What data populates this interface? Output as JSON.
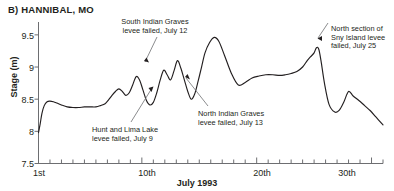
{
  "panel": {
    "title": "B) HANNIBAL, MO"
  },
  "axes": {
    "y_label": "Stage (m)",
    "x_label": "July 1993",
    "y_ticks": [
      "7.5",
      "8",
      "8.5",
      "9",
      "9.5"
    ],
    "y_tick_values": [
      7.5,
      8,
      8.5,
      9,
      9.5
    ],
    "x_ticks": [
      "1st",
      "10th",
      "20th",
      "30th"
    ],
    "x_tick_values": [
      1,
      10,
      20,
      30
    ]
  },
  "annotations": [
    {
      "name": "south-indian-graves",
      "line1": "South Indian Graves",
      "line2": "levee failed, July 12",
      "align": "center"
    },
    {
      "name": "hunt-and-lima-lake",
      "line1": "Hunt and Lima Lake",
      "line2": "levee failed, July 9",
      "align": "left"
    },
    {
      "name": "north-indian-graves",
      "line1": "North Indian Graves",
      "line2": "levee failed, July 13",
      "align": "left"
    },
    {
      "name": "sny-island-levee",
      "line1": "North section of",
      "line2": "Sny Island levee",
      "line3": "failed, July 25",
      "align": "left"
    }
  ],
  "colors": {
    "line": "#231f20",
    "axis": "#6d6e71",
    "text": "#231f20",
    "background": "#ffffff"
  },
  "chart_data": {
    "type": "line",
    "title": "B) HANNIBAL, MO",
    "xlabel": "July 1993",
    "ylabel": "Stage (m)",
    "xlim": [
      1,
      31
    ],
    "ylim": [
      7.5,
      9.7
    ],
    "grid": false,
    "legend": "none",
    "x_unit": "day of July 1993",
    "series": [
      {
        "name": "Mississippi River stage at Hannibal, MO",
        "x": [
          1.0,
          1.15,
          1.3,
          1.5,
          1.75,
          2.0,
          2.3,
          2.6,
          3.0,
          3.5,
          4.0,
          4.5,
          5.0,
          5.5,
          6.0,
          6.4,
          6.8,
          7.1,
          7.4,
          7.7,
          8.0,
          8.3,
          8.6,
          8.9,
          9.2,
          9.5,
          9.8,
          10.1,
          10.4,
          10.7,
          11.0,
          11.3,
          11.6,
          11.9,
          12.2,
          12.5,
          12.8,
          13.1,
          13.4,
          13.7,
          14.0,
          14.3,
          14.6,
          14.9,
          15.2,
          15.5,
          15.9,
          16.3,
          16.7,
          17.2,
          17.8,
          18.4,
          19.0,
          19.6,
          20.2,
          20.8,
          21.4,
          22.0,
          22.5,
          23.0,
          23.5,
          24.0,
          24.4,
          24.7,
          25.0,
          25.2,
          25.4,
          25.6,
          25.9,
          26.3,
          26.8,
          27.2,
          27.6,
          28.0,
          28.4,
          28.9,
          29.4,
          29.9,
          30.4,
          30.9,
          31.0
        ],
        "y": [
          7.98,
          8.12,
          8.28,
          8.4,
          8.46,
          8.47,
          8.46,
          8.44,
          8.41,
          8.38,
          8.37,
          8.37,
          8.38,
          8.38,
          8.38,
          8.4,
          8.43,
          8.49,
          8.56,
          8.62,
          8.66,
          8.62,
          8.56,
          8.6,
          8.72,
          8.85,
          8.8,
          8.64,
          8.48,
          8.41,
          8.45,
          8.6,
          8.8,
          8.95,
          8.88,
          8.8,
          8.94,
          9.1,
          8.98,
          8.8,
          8.62,
          8.5,
          8.58,
          8.78,
          9.0,
          9.22,
          9.38,
          9.46,
          9.4,
          9.18,
          8.9,
          8.72,
          8.76,
          8.83,
          8.86,
          8.88,
          8.88,
          8.87,
          8.88,
          8.9,
          8.93,
          9.0,
          9.1,
          9.16,
          9.22,
          9.3,
          9.28,
          9.1,
          8.75,
          8.42,
          8.3,
          8.33,
          8.46,
          8.62,
          8.55,
          8.48,
          8.4,
          8.32,
          8.22,
          8.12,
          8.1
        ]
      }
    ],
    "annotated_events": [
      {
        "label": "Hunt and Lima Lake levee failed, July 9",
        "day": 9.4,
        "stage": 8.82
      },
      {
        "label": "South Indian Graves levee failed, July 12",
        "day": 12.1,
        "stage": 8.9
      },
      {
        "label": "North Indian Graves levee failed, July 13",
        "day": 13.9,
        "stage": 8.68
      },
      {
        "label": "North section of Sny Island levee failed, July 25",
        "day": 25.3,
        "stage": 9.29
      }
    ]
  }
}
